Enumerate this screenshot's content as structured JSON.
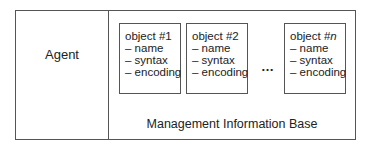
{
  "diagram": {
    "agent": {
      "label": "Agent"
    },
    "mib": {
      "label": "Management Information Base",
      "objects": [
        {
          "title_prefix": "object #",
          "title_index": "1",
          "attributes": [
            "– name",
            "– syntax",
            "– encoding"
          ]
        },
        {
          "title_prefix": "object #",
          "title_index": "2",
          "attributes": [
            "– name",
            "– syntax",
            "– encoding"
          ]
        },
        {
          "title_prefix": "object #",
          "title_index": "n",
          "attributes": [
            "– name",
            "– syntax",
            "– encoding"
          ]
        }
      ],
      "ellipsis": "…"
    },
    "colors": {
      "border": "#555555",
      "text": "#222222",
      "background": "#ffffff"
    }
  }
}
